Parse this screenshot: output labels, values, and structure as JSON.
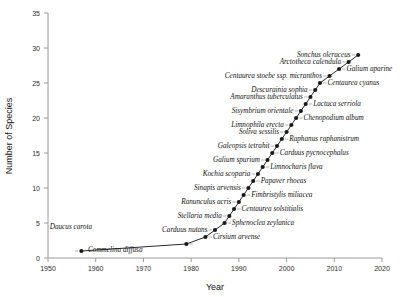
{
  "chart_data": {
    "type": "line",
    "title": "",
    "xlabel": "Year",
    "ylabel": "Number of Species",
    "xlim": [
      1950,
      2020
    ],
    "ylim": [
      0,
      35
    ],
    "xticks": [
      1950,
      1960,
      1970,
      1980,
      1990,
      2000,
      2010,
      2020
    ],
    "yticks": [
      0,
      5,
      10,
      15,
      20,
      25,
      30,
      35
    ],
    "grid": false,
    "legend": null,
    "marker": "filled-circle",
    "series": [
      {
        "name": "Cumulative number of species",
        "x": [
          1957,
          1979,
          1983,
          1985,
          1987,
          1988,
          1989,
          1990,
          1991,
          1992,
          1993,
          1994,
          1995,
          1996,
          1997,
          1998,
          1999,
          2000,
          2001,
          2002,
          2003,
          2004,
          2005,
          2006,
          2007,
          2009,
          2011,
          2013,
          2015
        ],
        "values": [
          1,
          2,
          3,
          4,
          5,
          6,
          7,
          8,
          9,
          10,
          11,
          12,
          13,
          14,
          15,
          16,
          17,
          18,
          19,
          20,
          21,
          22,
          23,
          24,
          25,
          26,
          27,
          28,
          29
        ],
        "point_labels": [
          "Commelina diffusa",
          "Cirsium arvense",
          "Carduus nutans",
          "Sphenoclea zeylanica",
          "Stellaria media",
          "Centaurea solstitialis",
          "Ranunculus acris",
          "Fimbristylis miliacea",
          "Sinapis arvensis",
          "Papaver rhoeas",
          "Kochia scoparia",
          "Limnocharis flava",
          "Galium spurium",
          "Carduus pycnocephalus",
          "Galeopsis tetrahit",
          "Raphanus raphanistrum",
          "Soliva sessilis",
          "Limnophila erecta",
          "Chenopodium album",
          "Sisymbrium orientale",
          "Lactuca serriola",
          "Amaranthus tuberculatus",
          "Descurainia sophia",
          "Centaurea cyanus",
          "Centaurea stoebe ssp. micranthos",
          "Galium aparine",
          "Arctotheca calendula",
          "Sonchus oleraceus",
          "Daucus carota"
        ]
      }
    ],
    "annotations": [
      {
        "text": "Daucus carota",
        "side": "left"
      },
      {
        "text": "Commelina diffusa",
        "side": "right"
      },
      {
        "text": "Cirsium arvense",
        "side": "right"
      },
      {
        "text": "Carduus nutans",
        "side": "left"
      },
      {
        "text": "Sphenoclea zeylanica",
        "side": "right"
      },
      {
        "text": "Stellaria media",
        "side": "left"
      },
      {
        "text": "Centaurea solstitialis",
        "side": "right"
      },
      {
        "text": "Ranunculus acris",
        "side": "left"
      },
      {
        "text": "Fimbristylis miliacea",
        "side": "right"
      },
      {
        "text": "Sinapis arvensis",
        "side": "left"
      },
      {
        "text": "Papaver rhoeas",
        "side": "right"
      },
      {
        "text": "Kochia scoparia",
        "side": "left"
      },
      {
        "text": "Limnocharis flava",
        "side": "right"
      },
      {
        "text": "Galium spurium",
        "side": "left"
      },
      {
        "text": "Carduus pycnocephalus",
        "side": "right"
      },
      {
        "text": "Galeopsis tetrahit",
        "side": "left"
      },
      {
        "text": "Raphanus raphanistrum",
        "side": "right"
      },
      {
        "text": "Soliva sessilis",
        "side": "left"
      },
      {
        "text": "Limnophila erecta",
        "side": "left"
      },
      {
        "text": "Chenopodium album",
        "side": "right"
      },
      {
        "text": "Sisymbrium orientale",
        "side": "left"
      },
      {
        "text": "Lactuca serriola",
        "side": "right"
      },
      {
        "text": "Amaranthus tuberculatus",
        "side": "left"
      },
      {
        "text": "Descurainia sophia",
        "side": "left"
      },
      {
        "text": "Centaurea cyanus",
        "side": "right"
      },
      {
        "text": "Centaurea stoebe ssp. micranthos",
        "side": "left"
      },
      {
        "text": "Galium aparine",
        "side": "right"
      },
      {
        "text": "Arctotheca calendula",
        "side": "left"
      },
      {
        "text": "Sonchus oleraceus",
        "side": "left"
      }
    ]
  },
  "axes": {
    "x_title": "Year",
    "y_title": "Number of Species",
    "x_tick_labels": [
      "1950",
      "1960",
      "1970",
      "1980",
      "1990",
      "2000",
      "2010",
      "2020"
    ],
    "y_tick_labels": [
      "0",
      "5",
      "10",
      "15",
      "20",
      "25",
      "30",
      "35"
    ]
  },
  "colors": {
    "line": "#2a2a2a",
    "marker": "#1a1a1a",
    "axis": "#9a9a9a",
    "leader": "#7d7d7d",
    "text": "#111111",
    "background": "#ffffff"
  }
}
